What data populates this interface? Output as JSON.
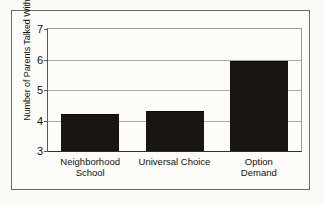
{
  "chart_data": {
    "type": "bar",
    "title": "",
    "subtitle": "",
    "xlabel": "",
    "ylabel": "Number of Parents Talked With",
    "categories": [
      "Neighborhood\nSchool",
      "Universal Choice",
      "Option Demand"
    ],
    "values": [
      4.2,
      4.3,
      5.95
    ],
    "ylim": [
      3,
      7
    ],
    "yticks": [
      3,
      4,
      5,
      6,
      7
    ],
    "ytick_labels": [
      "3",
      "4",
      "5",
      "6",
      "7"
    ],
    "grid": true,
    "legend": false,
    "legend_position": "none",
    "bar_color": "#191510",
    "plot_background": "#fdfcf8",
    "figure_background": "#fbfaf6",
    "frame_color": "#6b6b63",
    "gridline_color": "#a9a9a1",
    "text_color": "#111111"
  }
}
